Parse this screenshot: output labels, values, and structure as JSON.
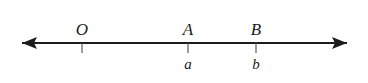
{
  "figure": {
    "type": "number-line",
    "background_color": "#ffffff",
    "stroke_color": "#1c1c1c",
    "width": 368,
    "height": 83,
    "axis": {
      "y": 43,
      "x_start": 22,
      "x_end": 347,
      "thickness": 2,
      "left_arrow": true,
      "right_arrow": true,
      "arrow_size": 9
    },
    "points": [
      {
        "name": "origin",
        "x": 82,
        "tick": true,
        "tick_direction": "down",
        "upper_label": "O",
        "lower_label": ""
      },
      {
        "name": "point-a",
        "x": 188,
        "tick": true,
        "tick_direction": "down",
        "upper_label": "A",
        "lower_label": "a"
      },
      {
        "name": "point-b",
        "x": 256,
        "tick": true,
        "tick_direction": "down",
        "upper_label": "B",
        "lower_label": "b"
      }
    ]
  }
}
